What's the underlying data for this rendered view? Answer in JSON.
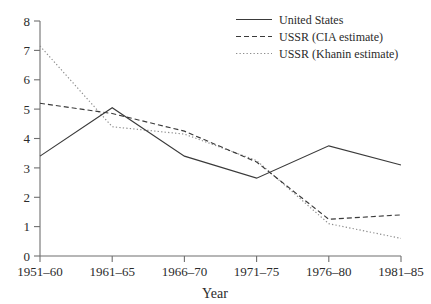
{
  "chart_data": {
    "type": "line",
    "title": "",
    "subtitle": "",
    "xlabel": "Year",
    "ylabel": "",
    "categories": [
      "1951–60",
      "1961–65",
      "1966–70",
      "1971–75",
      "1976–80",
      "1981–85"
    ],
    "ylim": [
      0,
      8
    ],
    "yticks": [
      0,
      1,
      2,
      3,
      4,
      5,
      6,
      7,
      8
    ],
    "ytick_labels": [
      "0",
      "1",
      "2",
      "3",
      "4",
      "5",
      "6",
      "7",
      "8"
    ],
    "grid": false,
    "legend_position": "top-right",
    "series": [
      {
        "name": "United States",
        "style": "solid",
        "color": "#3a3a3a",
        "values": [
          3.4,
          5.05,
          3.4,
          2.65,
          3.75,
          3.1
        ]
      },
      {
        "name": "USSR (CIA estimate)",
        "style": "dashed",
        "color": "#3a3a3a",
        "values": [
          5.2,
          4.85,
          4.25,
          3.2,
          1.25,
          1.4
        ]
      },
      {
        "name": "USSR (Khanin estimate)",
        "style": "dotted",
        "color": "#8c8c8c",
        "values": [
          7.15,
          4.4,
          4.15,
          3.25,
          1.1,
          0.6
        ]
      }
    ]
  },
  "axes": {
    "x_axis_title": "Year"
  },
  "legend": {
    "entries": [
      {
        "label": "United States",
        "style": "solid"
      },
      {
        "label": "USSR (CIA estimate)",
        "style": "dashed"
      },
      {
        "label": "USSR (Khanin estimate)",
        "style": "dotted"
      }
    ]
  }
}
